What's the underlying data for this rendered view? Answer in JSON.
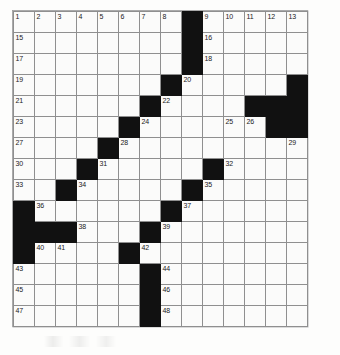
{
  "puzzle": {
    "type": "crossword-grid",
    "rows": 15,
    "columns": 14,
    "cell_size_px": 21,
    "colors": {
      "block": "#111111",
      "cell": "#fbfbfa",
      "grid_line": "#8f8f8f",
      "number_text": "#1a1a1a",
      "page_background": "#ffffff"
    },
    "grid": [
      [
        {
          "block": false,
          "num": "1"
        },
        {
          "block": false,
          "num": "2"
        },
        {
          "block": false,
          "num": "3"
        },
        {
          "block": false,
          "num": "4"
        },
        {
          "block": false,
          "num": "5"
        },
        {
          "block": false,
          "num": "6"
        },
        {
          "block": false,
          "num": "7"
        },
        {
          "block": false,
          "num": "8"
        },
        {
          "block": true,
          "num": ""
        },
        {
          "block": false,
          "num": "9"
        },
        {
          "block": false,
          "num": "10"
        },
        {
          "block": false,
          "num": "11"
        },
        {
          "block": false,
          "num": "12"
        },
        {
          "block": false,
          "num": "13"
        }
      ],
      [
        {
          "block": false,
          "num": "15"
        },
        {
          "block": false,
          "num": ""
        },
        {
          "block": false,
          "num": ""
        },
        {
          "block": false,
          "num": ""
        },
        {
          "block": false,
          "num": ""
        },
        {
          "block": false,
          "num": ""
        },
        {
          "block": false,
          "num": ""
        },
        {
          "block": false,
          "num": ""
        },
        {
          "block": true,
          "num": ""
        },
        {
          "block": false,
          "num": "16"
        },
        {
          "block": false,
          "num": ""
        },
        {
          "block": false,
          "num": ""
        },
        {
          "block": false,
          "num": ""
        },
        {
          "block": false,
          "num": ""
        }
      ],
      [
        {
          "block": false,
          "num": "17"
        },
        {
          "block": false,
          "num": ""
        },
        {
          "block": false,
          "num": ""
        },
        {
          "block": false,
          "num": ""
        },
        {
          "block": false,
          "num": ""
        },
        {
          "block": false,
          "num": ""
        },
        {
          "block": false,
          "num": ""
        },
        {
          "block": false,
          "num": ""
        },
        {
          "block": true,
          "num": ""
        },
        {
          "block": false,
          "num": "18"
        },
        {
          "block": false,
          "num": ""
        },
        {
          "block": false,
          "num": ""
        },
        {
          "block": false,
          "num": ""
        },
        {
          "block": false,
          "num": ""
        }
      ],
      [
        {
          "block": false,
          "num": "19"
        },
        {
          "block": false,
          "num": ""
        },
        {
          "block": false,
          "num": ""
        },
        {
          "block": false,
          "num": ""
        },
        {
          "block": false,
          "num": ""
        },
        {
          "block": false,
          "num": ""
        },
        {
          "block": false,
          "num": ""
        },
        {
          "block": true,
          "num": ""
        },
        {
          "block": false,
          "num": "20"
        },
        {
          "block": false,
          "num": ""
        },
        {
          "block": false,
          "num": ""
        },
        {
          "block": false,
          "num": ""
        },
        {
          "block": false,
          "num": ""
        },
        {
          "block": true,
          "num": ""
        }
      ],
      [
        {
          "block": false,
          "num": "21"
        },
        {
          "block": false,
          "num": ""
        },
        {
          "block": false,
          "num": ""
        },
        {
          "block": false,
          "num": ""
        },
        {
          "block": false,
          "num": ""
        },
        {
          "block": false,
          "num": ""
        },
        {
          "block": true,
          "num": ""
        },
        {
          "block": false,
          "num": "22"
        },
        {
          "block": false,
          "num": ""
        },
        {
          "block": false,
          "num": ""
        },
        {
          "block": false,
          "num": ""
        },
        {
          "block": true,
          "num": ""
        },
        {
          "block": true,
          "num": ""
        },
        {
          "block": true,
          "num": ""
        }
      ],
      [
        {
          "block": false,
          "num": "23"
        },
        {
          "block": false,
          "num": ""
        },
        {
          "block": false,
          "num": ""
        },
        {
          "block": false,
          "num": ""
        },
        {
          "block": false,
          "num": ""
        },
        {
          "block": true,
          "num": ""
        },
        {
          "block": false,
          "num": "24"
        },
        {
          "block": false,
          "num": ""
        },
        {
          "block": false,
          "num": ""
        },
        {
          "block": false,
          "num": ""
        },
        {
          "block": false,
          "num": "25"
        },
        {
          "block": false,
          "num": "26"
        },
        {
          "block": true,
          "num": ""
        },
        {
          "block": true,
          "num": ""
        }
      ],
      [
        {
          "block": false,
          "num": "27"
        },
        {
          "block": false,
          "num": ""
        },
        {
          "block": false,
          "num": ""
        },
        {
          "block": false,
          "num": ""
        },
        {
          "block": true,
          "num": ""
        },
        {
          "block": false,
          "num": "28"
        },
        {
          "block": false,
          "num": ""
        },
        {
          "block": false,
          "num": ""
        },
        {
          "block": false,
          "num": ""
        },
        {
          "block": false,
          "num": ""
        },
        {
          "block": false,
          "num": ""
        },
        {
          "block": false,
          "num": ""
        },
        {
          "block": false,
          "num": ""
        },
        {
          "block": false,
          "num": "29"
        }
      ],
      [
        {
          "block": false,
          "num": "30"
        },
        {
          "block": false,
          "num": ""
        },
        {
          "block": false,
          "num": ""
        },
        {
          "block": true,
          "num": ""
        },
        {
          "block": false,
          "num": "31"
        },
        {
          "block": false,
          "num": ""
        },
        {
          "block": false,
          "num": ""
        },
        {
          "block": false,
          "num": ""
        },
        {
          "block": false,
          "num": ""
        },
        {
          "block": true,
          "num": ""
        },
        {
          "block": false,
          "num": "32"
        },
        {
          "block": false,
          "num": ""
        },
        {
          "block": false,
          "num": ""
        },
        {
          "block": false,
          "num": ""
        }
      ],
      [
        {
          "block": false,
          "num": "33"
        },
        {
          "block": false,
          "num": ""
        },
        {
          "block": true,
          "num": ""
        },
        {
          "block": false,
          "num": "34"
        },
        {
          "block": false,
          "num": ""
        },
        {
          "block": false,
          "num": ""
        },
        {
          "block": false,
          "num": ""
        },
        {
          "block": false,
          "num": ""
        },
        {
          "block": true,
          "num": ""
        },
        {
          "block": false,
          "num": "35"
        },
        {
          "block": false,
          "num": ""
        },
        {
          "block": false,
          "num": ""
        },
        {
          "block": false,
          "num": ""
        },
        {
          "block": false,
          "num": ""
        }
      ],
      [
        {
          "block": true,
          "num": ""
        },
        {
          "block": false,
          "num": "36"
        },
        {
          "block": false,
          "num": ""
        },
        {
          "block": false,
          "num": ""
        },
        {
          "block": false,
          "num": ""
        },
        {
          "block": false,
          "num": ""
        },
        {
          "block": false,
          "num": ""
        },
        {
          "block": true,
          "num": ""
        },
        {
          "block": false,
          "num": "37"
        },
        {
          "block": false,
          "num": ""
        },
        {
          "block": false,
          "num": ""
        },
        {
          "block": false,
          "num": ""
        },
        {
          "block": false,
          "num": ""
        },
        {
          "block": false,
          "num": ""
        }
      ],
      [
        {
          "block": true,
          "num": ""
        },
        {
          "block": true,
          "num": ""
        },
        {
          "block": true,
          "num": ""
        },
        {
          "block": false,
          "num": "38"
        },
        {
          "block": false,
          "num": ""
        },
        {
          "block": false,
          "num": ""
        },
        {
          "block": true,
          "num": ""
        },
        {
          "block": false,
          "num": "39"
        },
        {
          "block": false,
          "num": ""
        },
        {
          "block": false,
          "num": ""
        },
        {
          "block": false,
          "num": ""
        },
        {
          "block": false,
          "num": ""
        },
        {
          "block": false,
          "num": ""
        },
        {
          "block": false,
          "num": ""
        }
      ],
      [
        {
          "block": true,
          "num": ""
        },
        {
          "block": false,
          "num": "40"
        },
        {
          "block": false,
          "num": "41"
        },
        {
          "block": false,
          "num": ""
        },
        {
          "block": false,
          "num": ""
        },
        {
          "block": true,
          "num": ""
        },
        {
          "block": false,
          "num": "42"
        },
        {
          "block": false,
          "num": ""
        },
        {
          "block": false,
          "num": ""
        },
        {
          "block": false,
          "num": ""
        },
        {
          "block": false,
          "num": ""
        },
        {
          "block": false,
          "num": ""
        },
        {
          "block": false,
          "num": ""
        },
        {
          "block": false,
          "num": ""
        }
      ],
      [
        {
          "block": false,
          "num": "43"
        },
        {
          "block": false,
          "num": ""
        },
        {
          "block": false,
          "num": ""
        },
        {
          "block": false,
          "num": ""
        },
        {
          "block": false,
          "num": ""
        },
        {
          "block": false,
          "num": ""
        },
        {
          "block": true,
          "num": ""
        },
        {
          "block": false,
          "num": "44"
        },
        {
          "block": false,
          "num": ""
        },
        {
          "block": false,
          "num": ""
        },
        {
          "block": false,
          "num": ""
        },
        {
          "block": false,
          "num": ""
        },
        {
          "block": false,
          "num": ""
        },
        {
          "block": false,
          "num": ""
        }
      ],
      [
        {
          "block": false,
          "num": "45"
        },
        {
          "block": false,
          "num": ""
        },
        {
          "block": false,
          "num": ""
        },
        {
          "block": false,
          "num": ""
        },
        {
          "block": false,
          "num": ""
        },
        {
          "block": false,
          "num": ""
        },
        {
          "block": true,
          "num": ""
        },
        {
          "block": false,
          "num": "46"
        },
        {
          "block": false,
          "num": ""
        },
        {
          "block": false,
          "num": ""
        },
        {
          "block": false,
          "num": ""
        },
        {
          "block": false,
          "num": ""
        },
        {
          "block": false,
          "num": ""
        },
        {
          "block": false,
          "num": ""
        }
      ],
      [
        {
          "block": false,
          "num": "47"
        },
        {
          "block": false,
          "num": ""
        },
        {
          "block": false,
          "num": ""
        },
        {
          "block": false,
          "num": ""
        },
        {
          "block": false,
          "num": ""
        },
        {
          "block": false,
          "num": ""
        },
        {
          "block": true,
          "num": ""
        },
        {
          "block": false,
          "num": "48"
        },
        {
          "block": false,
          "num": ""
        },
        {
          "block": false,
          "num": ""
        },
        {
          "block": false,
          "num": ""
        },
        {
          "block": false,
          "num": ""
        },
        {
          "block": false,
          "num": ""
        },
        {
          "block": false,
          "num": ""
        }
      ]
    ]
  }
}
